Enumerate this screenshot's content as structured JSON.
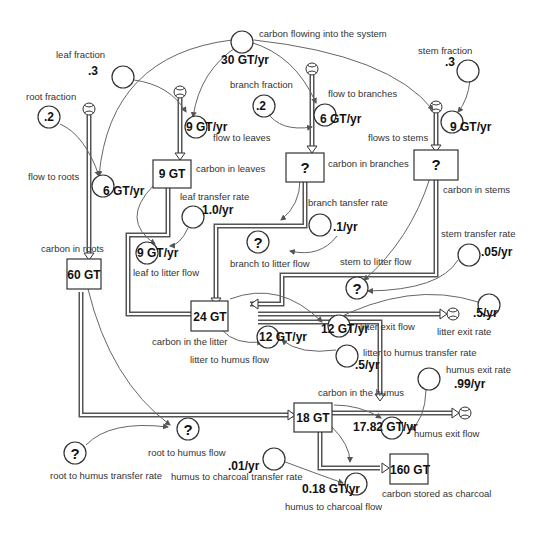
{
  "diagram": {
    "type": "stock-and-flow",
    "stocks": [
      {
        "id": "leaves",
        "label": "carbon in leaves",
        "value": "9 GT"
      },
      {
        "id": "branches",
        "label": "carbon in branches",
        "value": "?"
      },
      {
        "id": "stems",
        "label": "carbon in stems",
        "value": "?"
      },
      {
        "id": "roots",
        "label": "carbon in roots",
        "value": "60 GT"
      },
      {
        "id": "litter",
        "label": "carbon in the litter",
        "value": "24 GT"
      },
      {
        "id": "humus",
        "label": "carbon in the humus",
        "value": "18 GT"
      },
      {
        "id": "charcoal",
        "label": "carbon stored as charcoal",
        "value": "160 GT"
      }
    ],
    "flows": [
      {
        "id": "inflow",
        "label": "carbon flowing into the system",
        "value": "30 GT/yr"
      },
      {
        "id": "to_leaves",
        "label": "flow to leaves",
        "value": "9 GT/yr"
      },
      {
        "id": "to_branches",
        "label": "flow to branches",
        "value": "6 GT/yr"
      },
      {
        "id": "to_stems",
        "label": "flows to stems",
        "value": "9 GT/yr"
      },
      {
        "id": "to_roots",
        "label": "flow to roots",
        "value": "6 GT/yr"
      },
      {
        "id": "leaf_litter",
        "label": "leaf to litter flow",
        "value": "9 GT/yr"
      },
      {
        "id": "branch_litter",
        "label": "branch to litter flow",
        "value": "?"
      },
      {
        "id": "stem_litter",
        "label": "stem to litter flow",
        "value": "?"
      },
      {
        "id": "litter_exit",
        "label": "litter exit flow",
        "value": "12 GT/yr"
      },
      {
        "id": "litter_humus",
        "label": "litter to humus flow",
        "value": "12 GT/yr"
      },
      {
        "id": "root_humus",
        "label": "root to humus flow",
        "value": "?"
      },
      {
        "id": "humus_exit",
        "label": "humus exit flow",
        "value": "17.82 GT/yr"
      },
      {
        "id": "humus_charcoal",
        "label": "humus to charcoal flow",
        "value": "0.18 GT/yr"
      }
    ],
    "parameters": [
      {
        "id": "leaf_fraction",
        "label": "leaf fraction",
        "value": ".3"
      },
      {
        "id": "branch_fraction",
        "label": "branch fraction",
        "value": ".2"
      },
      {
        "id": "stem_fraction",
        "label": "stem fraction",
        "value": ".3"
      },
      {
        "id": "root_fraction",
        "label": "root fraction",
        "value": ".2"
      },
      {
        "id": "leaf_rate",
        "label": "leaf transfer rate",
        "value": "1.0/yr"
      },
      {
        "id": "branch_rate",
        "label": "branch tansfer rate",
        "value": ".1/yr"
      },
      {
        "id": "stem_rate",
        "label": "stem transfer rate",
        "value": ".05/yr"
      },
      {
        "id": "litter_exit_rate",
        "label": "litter exit rate",
        "value": ".5/yr"
      },
      {
        "id": "litter_humus_rate",
        "label": "litter to humus transfer rate",
        "value": ".5/yr"
      },
      {
        "id": "root_humus_rate",
        "label": "root to humus transfer rate",
        "value": "?"
      },
      {
        "id": "humus_exit_rate",
        "label": "humus exit rate",
        "value": ".99/yr"
      },
      {
        "id": "humus_charcoal_rate",
        "label": "humus to charcoal transfer rate",
        "value": ".01/yr"
      }
    ]
  },
  "colors": {
    "ink": "#333333",
    "pipe": "#555555",
    "connector": "#666666",
    "background": "#ffffff"
  }
}
